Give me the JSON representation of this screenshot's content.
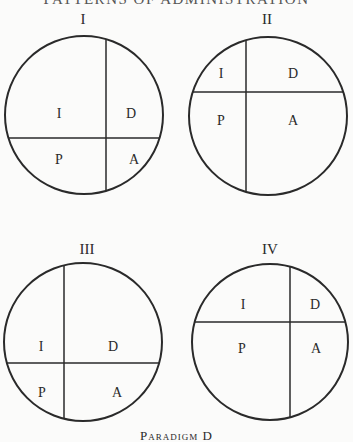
{
  "header": {
    "text": "PATTERNS OF ADMINISTRATION"
  },
  "caption": {
    "text": "Paradigm D"
  },
  "diagrams": [
    {
      "id": "I",
      "title": "I",
      "title_pos": [
        83,
        24
      ],
      "cx": 84,
      "cy": 115,
      "r": 79,
      "vline_x": 106,
      "hline_y": 138,
      "cells": [
        {
          "label": "I",
          "x": 59,
          "y": 118
        },
        {
          "label": "D",
          "x": 131,
          "y": 118
        },
        {
          "label": "P",
          "x": 59,
          "y": 164
        },
        {
          "label": "A",
          "x": 134,
          "y": 164
        }
      ]
    },
    {
      "id": "II",
      "title": "II",
      "title_pos": [
        267,
        24
      ],
      "cx": 268,
      "cy": 116,
      "r": 79,
      "vline_x": 246,
      "hline_y": 92,
      "cells": [
        {
          "label": "I",
          "x": 221,
          "y": 78
        },
        {
          "label": "D",
          "x": 293,
          "y": 78
        },
        {
          "label": "P",
          "x": 221,
          "y": 125
        },
        {
          "label": "A",
          "x": 293,
          "y": 125
        }
      ]
    },
    {
      "id": "III",
      "title": "III",
      "title_pos": [
        87,
        254
      ],
      "cx": 83,
      "cy": 342,
      "r": 79,
      "vline_x": 64,
      "hline_y": 363,
      "cells": [
        {
          "label": "I",
          "x": 41,
          "y": 351
        },
        {
          "label": "D",
          "x": 113,
          "y": 351
        },
        {
          "label": "P",
          "x": 42,
          "y": 397
        },
        {
          "label": "A",
          "x": 117,
          "y": 397
        }
      ]
    },
    {
      "id": "IV",
      "title": "IV",
      "title_pos": [
        270,
        254
      ],
      "cx": 270,
      "cy": 342,
      "r": 78,
      "vline_x": 290,
      "hline_y": 322,
      "cells": [
        {
          "label": "I",
          "x": 243,
          "y": 309
        },
        {
          "label": "D",
          "x": 315,
          "y": 309
        },
        {
          "label": "P",
          "x": 242,
          "y": 353
        },
        {
          "label": "A",
          "x": 316,
          "y": 353
        }
      ]
    }
  ],
  "colors": {
    "line": "#2a2a2a",
    "background": "#fbfbfa"
  }
}
